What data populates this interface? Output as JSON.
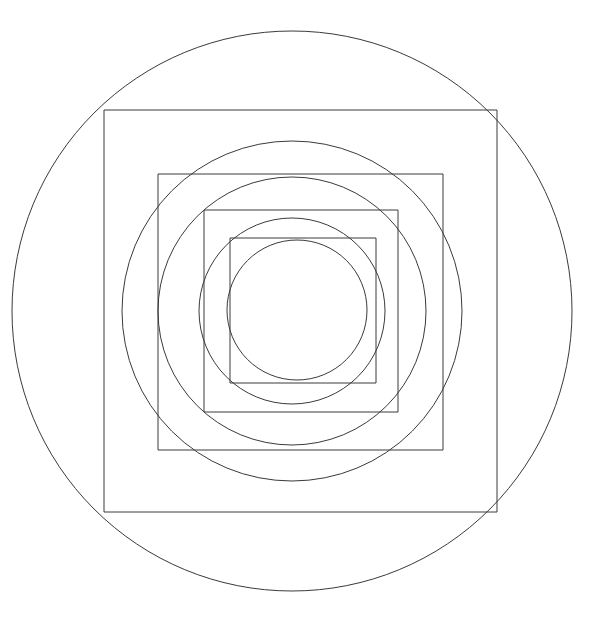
{
  "figure": {
    "canvas": {
      "width": 594,
      "height": 629,
      "background_color": "#ffffff"
    },
    "style": {
      "stroke_color": "#3a3a3a",
      "stroke_width": 1,
      "fill": "none"
    },
    "center": {
      "x": 292,
      "y": 311
    },
    "shape_count": 9,
    "shapes": [
      {
        "index": 0,
        "kind": "circle",
        "name": "outer-circle",
        "cx": 292,
        "cy": 311,
        "r": 280
      },
      {
        "index": 1,
        "kind": "square",
        "name": "square-1",
        "x": 104,
        "y": 110,
        "width": 393,
        "height": 402
      },
      {
        "index": 2,
        "kind": "circle",
        "name": "circle-2",
        "cx": 292,
        "cy": 311,
        "r": 170
      },
      {
        "index": 3,
        "kind": "square",
        "name": "square-2",
        "x": 158,
        "y": 174,
        "width": 285,
        "height": 276
      },
      {
        "index": 4,
        "kind": "circle",
        "name": "circle-3",
        "cx": 292,
        "cy": 311,
        "r": 134
      },
      {
        "index": 5,
        "kind": "square",
        "name": "square-3",
        "x": 204,
        "y": 210,
        "width": 194,
        "height": 202
      },
      {
        "index": 6,
        "kind": "circle",
        "name": "circle-4",
        "cx": 292,
        "cy": 311,
        "r": 93
      },
      {
        "index": 7,
        "kind": "square",
        "name": "square-4",
        "x": 230,
        "y": 238,
        "width": 146,
        "height": 145
      },
      {
        "index": 8,
        "kind": "circle",
        "name": "inner-circle",
        "cx": 297,
        "cy": 310,
        "r": 70
      }
    ]
  }
}
